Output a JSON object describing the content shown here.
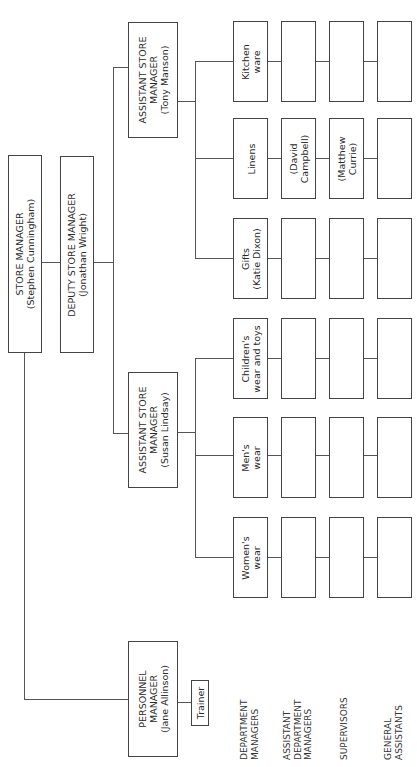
{
  "chart": {
    "store_manager": {
      "title": "STORE MANAGER",
      "name": "(Stephen Cunningham)"
    },
    "deputy_store_manager": {
      "title": "DEPUTY STORE MANAGER",
      "name": "(Jonathan Wright)"
    },
    "assistant_store_manager_tony": {
      "line1": "ASSISTANT STORE",
      "line2": "MANAGER",
      "name": "(Tony Manson)"
    },
    "assistant_store_manager_susan": {
      "line1": "ASSISTANT STORE",
      "line2": "MANAGER",
      "name": "(Susan Lindsay)"
    },
    "personnel_manager": {
      "line1": "PERSONNEL",
      "line2": "MANAGER",
      "name": "(Jane Allinson)"
    },
    "trainer": {
      "label": "Trainer"
    },
    "departments": [
      {
        "line1": "Kitchen",
        "line2": "ware",
        "assistant": [
          "",
          ""
        ],
        "supervisor": [
          "",
          ""
        ],
        "general": ""
      },
      {
        "line1": "Linens",
        "line2": "",
        "assistant": [
          "(David",
          "Campbell)"
        ],
        "supervisor": [
          "(Matthew",
          "Currie)"
        ],
        "general": ""
      },
      {
        "line1": "Gifts",
        "line2": "(Katie Dixon)",
        "assistant": [
          "",
          ""
        ],
        "supervisor": [
          "",
          ""
        ],
        "general": ""
      },
      {
        "line1": "Children's",
        "line2": "wear and toys",
        "assistant": [
          "",
          ""
        ],
        "supervisor": [
          "",
          ""
        ],
        "general": ""
      },
      {
        "line1": "Men's",
        "line2": "wear",
        "assistant": [
          "",
          ""
        ],
        "supervisor": [
          "",
          ""
        ],
        "general": ""
      },
      {
        "line1": "Women's",
        "line2": "wear",
        "assistant": [
          "",
          ""
        ],
        "supervisor": [
          "",
          ""
        ],
        "general": ""
      }
    ],
    "level_labels": [
      [
        "DEPARTMENT",
        "MANAGERS"
      ],
      [
        "ASSISTANT",
        "DEPARTMENT",
        "MANAGERS"
      ],
      [
        "SUPERVISORS"
      ],
      [
        "GENERAL",
        "ASSISTANTS"
      ]
    ]
  }
}
